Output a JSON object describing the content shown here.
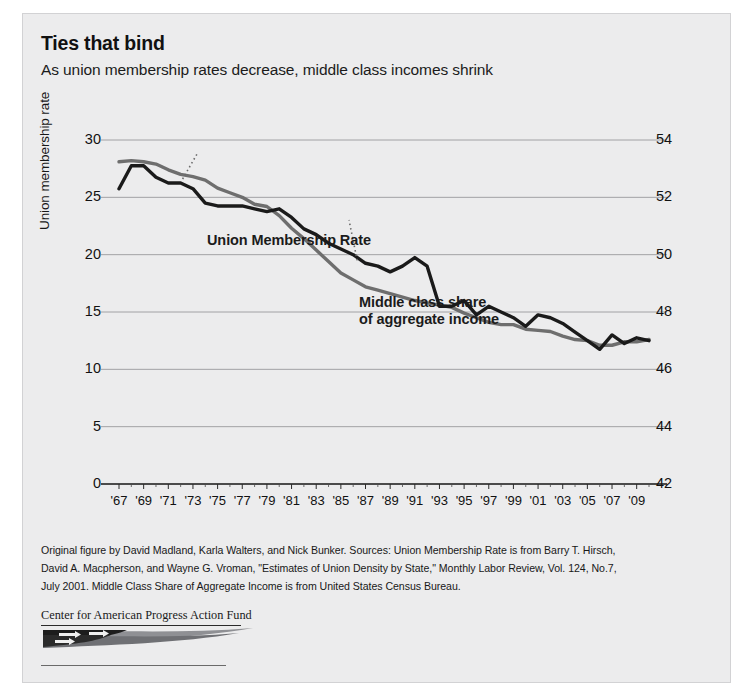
{
  "figure": {
    "title": "Ties that bind",
    "subtitle": "As union membership rates decrease, middle class incomes shrink",
    "background_color": "#ececed",
    "source_lines": [
      "Original figure by David Madland, Karla Walters, and Nick Bunker. Sources: Union Membership Rate is from Barry T. Hirsch,",
      "David A. Macpherson, and Wayne G. Vroman, \"Estimates of Union Density by State,\" Monthly Labor Review, Vol. 124, No.7,",
      "July 2001. Middle Class Share of Aggregate Income is from United States Census Bureau."
    ],
    "logo_text": "Center for American Progress Action Fund"
  },
  "chart_data": {
    "type": "line",
    "title": "Ties that bind",
    "subtitle": "As union membership rates decrease, middle class incomes shrink",
    "xlabel": "",
    "ylabel": "Union membership rate",
    "ylabel_right": "Middle class share of aggregate income",
    "ylim": [
      0,
      30
    ],
    "ylim_right": [
      42,
      54
    ],
    "yticks": [
      30,
      25,
      20,
      15,
      10,
      5,
      0
    ],
    "yticks_right": [
      54,
      52,
      50,
      48,
      46,
      44,
      42
    ],
    "grid": true,
    "legend_position": "inline-annotation",
    "x": [
      1967,
      1968,
      1969,
      1970,
      1971,
      1972,
      1973,
      1974,
      1975,
      1976,
      1977,
      1978,
      1979,
      1980,
      1981,
      1982,
      1983,
      1984,
      1985,
      1986,
      1987,
      1988,
      1989,
      1990,
      1991,
      1992,
      1993,
      1994,
      1995,
      1996,
      1997,
      1998,
      1999,
      2000,
      2001,
      2002,
      2003,
      2004,
      2005,
      2006,
      2007,
      2008,
      2009,
      2010
    ],
    "xticks": [
      "'67",
      "'69",
      "'71",
      "'73",
      "'75",
      "'77",
      "'79",
      "'81",
      "'83",
      "'85",
      "'87",
      "'89",
      "'91",
      "'93",
      "'95",
      "'97",
      "'99",
      "'01",
      "'03",
      "'05",
      "'07",
      "'09"
    ],
    "series": [
      {
        "name": "Union Membership Rate",
        "axis": "left",
        "color": "#6e6e6e",
        "units": "percent of workers",
        "values": [
          28.1,
          28.2,
          28.1,
          27.9,
          27.4,
          27.0,
          26.8,
          26.5,
          25.8,
          25.4,
          25.0,
          24.4,
          24.2,
          23.4,
          22.3,
          21.4,
          20.4,
          19.4,
          18.4,
          17.8,
          17.2,
          16.9,
          16.6,
          16.3,
          16.0,
          15.8,
          15.6,
          15.4,
          14.9,
          14.5,
          14.1,
          13.9,
          13.9,
          13.5,
          13.4,
          13.3,
          12.9,
          12.6,
          12.5,
          12.1,
          12.1,
          12.4,
          12.4,
          12.6
        ]
      },
      {
        "name": "Middle class share of aggregate income",
        "axis": "right",
        "color": "#1a1a1a",
        "units": "percent of aggregate income",
        "values": [
          52.3,
          53.1,
          53.1,
          52.7,
          52.5,
          52.5,
          52.3,
          51.8,
          51.7,
          51.7,
          51.7,
          51.6,
          51.5,
          51.6,
          51.3,
          50.9,
          50.7,
          50.4,
          50.2,
          50.0,
          49.7,
          49.6,
          49.4,
          49.6,
          49.9,
          49.6,
          48.2,
          48.2,
          48.4,
          47.9,
          48.2,
          48.0,
          47.8,
          47.5,
          47.9,
          47.8,
          47.6,
          47.3,
          47.0,
          46.7,
          47.2,
          46.9,
          47.1,
          47.0
        ]
      }
    ],
    "annotations": [
      {
        "text": "Union Membership Rate",
        "series": "Union Membership Rate"
      },
      {
        "text": "Middle class share\nof aggregate income",
        "series": "Middle class share of aggregate income"
      }
    ]
  },
  "legend": {
    "union_label": "Union Membership Rate",
    "middle_label_line1": "Middle class share",
    "middle_label_line2": "of aggregate income"
  }
}
